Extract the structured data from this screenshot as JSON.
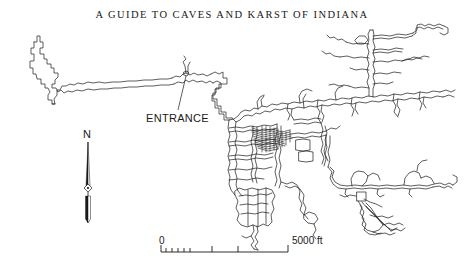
{
  "page": {
    "width": 464,
    "height": 263,
    "background_color": "#ffffff",
    "ink_color": "#1a1a1a"
  },
  "map": {
    "title": "A GUIDE TO CAVES AND KARST OF INDIANA",
    "type": "cave-survey-plan-map",
    "entrance": {
      "label": "ENTRANCE",
      "marker_x": 186,
      "marker_y": 73,
      "leader_from_x": 178,
      "leader_from_y": 110,
      "leader_to_x": 186,
      "leader_to_y": 76
    },
    "north_arrow": {
      "label": "N",
      "x": 88,
      "top_y": 142,
      "bottom_y": 223,
      "hub_y": 188
    },
    "scale_bar": {
      "left_label": "0",
      "right_label": "5000 ft",
      "unit": "ft",
      "max_value": 5000,
      "bar_left_x": 161,
      "bar_right_x": 288,
      "bar_y": 252,
      "major_ticks": [
        0,
        2000,
        3000,
        4000,
        5000
      ],
      "minor_tick_count": 5
    }
  }
}
